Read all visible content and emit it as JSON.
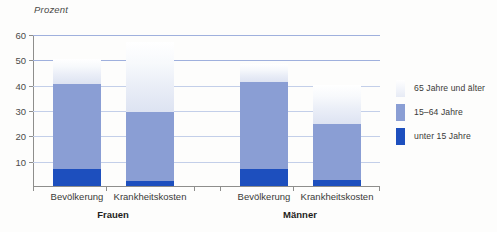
{
  "chart_data": {
    "type": "bar",
    "title": "",
    "subtitle": "",
    "ylabel": "Prozent",
    "xlabel": "",
    "ylim": [
      0,
      60
    ],
    "yticks": [
      10,
      20,
      30,
      40,
      50,
      60
    ],
    "ytick_labels": [
      "10",
      "20",
      "30",
      "40",
      "50",
      "60"
    ],
    "grid": true,
    "stacked": true,
    "legend_position": "right",
    "categories": [
      "Bevölkerung",
      "Krankheitskosten",
      "Bevölkerung",
      "Krankheitskosten"
    ],
    "groups": [
      "Frauen",
      "Männer"
    ],
    "series": [
      {
        "name": "unter 15 Jahre",
        "color": "#1d4fbe",
        "values": [
          6.8,
          2.0,
          6.7,
          2.3
        ]
      },
      {
        "name": "15–64 Jahre",
        "color": "#8a9ed4",
        "values": [
          33.4,
          27.3,
          34.3,
          22.0
        ]
      },
      {
        "name": "65 Jahre und älter",
        "color": "#eef1f8",
        "values": [
          9.8,
          27.7,
          7.0,
          15.7
        ]
      }
    ],
    "bar_totals": [
      50.0,
      57.0,
      48.0,
      40.0
    ]
  },
  "axis": {
    "y_title": "Prozent",
    "y_ticks": [
      {
        "value": 60,
        "label": "60"
      },
      {
        "value": 50,
        "label": "50"
      },
      {
        "value": 40,
        "label": "40"
      },
      {
        "value": 30,
        "label": "30"
      },
      {
        "value": 20,
        "label": "20"
      },
      {
        "value": 10,
        "label": "10"
      }
    ]
  },
  "bars": [
    {
      "id": "frauen-bevoelkerung",
      "category": "Bevölkerung",
      "group": "Frauen",
      "under15": 6.8,
      "mid": 33.4,
      "senior": 9.8
    },
    {
      "id": "frauen-krankheitskosten",
      "category": "Krankheitskosten",
      "group": "Frauen",
      "under15": 2.0,
      "mid": 27.3,
      "senior": 27.7
    },
    {
      "id": "maenner-bevoelkerung",
      "category": "Bevölkerung",
      "group": "Männer",
      "under15": 6.7,
      "mid": 34.3,
      "senior": 7.0
    },
    {
      "id": "maenner-krankheitskosten",
      "category": "Krankheitskosten",
      "group": "Männer",
      "under15": 2.3,
      "mid": 22.0,
      "senior": 15.7
    }
  ],
  "category_labels": [
    {
      "text": "Bevölkerung"
    },
    {
      "text": "Krankheitskosten"
    },
    {
      "text": "Bevölkerung"
    },
    {
      "text": "Krankheitskosten"
    }
  ],
  "group_labels": [
    {
      "text": "Frauen"
    },
    {
      "text": "Männer"
    }
  ],
  "legend": {
    "items": [
      {
        "label": "65 Jahre und älter",
        "color": "#eef1f8"
      },
      {
        "label": "15–64 Jahre",
        "color": "#8a9ed4"
      },
      {
        "label": "unter 15 Jahre",
        "color": "#1d4fbe"
      }
    ]
  },
  "colors": {
    "under15": "#1d4fbe",
    "age15to64": "#8a9ed4",
    "age65plus": "#eef1f8",
    "gridline": "#9fb0dd",
    "axis": "#8e8e8c",
    "background": "#fdfdfc",
    "text": "#3a3a38"
  }
}
